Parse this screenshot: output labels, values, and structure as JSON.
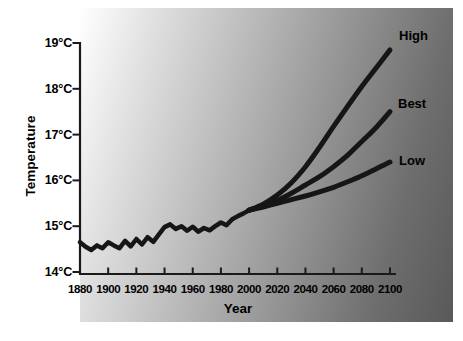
{
  "figure": {
    "background_color": "#ffffff",
    "panel_gradient": {
      "angle_deg": 105,
      "from": "#ffffff",
      "mid": "#a6a6a6",
      "to": "#595959"
    },
    "axis_color": "#1a1a1a",
    "text_color": "#000000"
  },
  "chart_data": {
    "type": "line",
    "title": "",
    "xlabel": "Year",
    "ylabel": "Temperature",
    "xlim": [
      1880,
      2100
    ],
    "ylim": [
      14,
      19
    ],
    "grid": false,
    "legend_position": "labels-at-curve-ends-right",
    "x_ticks": {
      "values": [
        1880,
        1900,
        1920,
        1940,
        1960,
        1980,
        2000,
        2020,
        2040,
        2060,
        2080,
        2100
      ],
      "labels": [
        "1880",
        "1900",
        "1920",
        "1940",
        "1960",
        "1980",
        "2000",
        "2020",
        "2040",
        "2060",
        "2080",
        "2100"
      ]
    },
    "y_ticks": {
      "values": [
        19,
        18,
        17,
        16,
        15,
        14
      ],
      "labels": [
        "19°C",
        "18°C",
        "17°C",
        "16°C",
        "15°C",
        "14°C"
      ]
    },
    "series": [
      {
        "name": "observed-temperature",
        "label": "",
        "color": "#161616",
        "width": 4.5,
        "smooth": false,
        "x": [
          1880,
          1884,
          1888,
          1892,
          1896,
          1900,
          1904,
          1908,
          1912,
          1916,
          1920,
          1924,
          1928,
          1932,
          1936,
          1940,
          1944,
          1948,
          1952,
          1956,
          1960,
          1964,
          1968,
          1972,
          1976,
          1980,
          1984,
          1988,
          1992,
          1996,
          2000
        ],
        "y": [
          14.65,
          14.55,
          14.48,
          14.58,
          14.52,
          14.65,
          14.58,
          14.52,
          14.68,
          14.56,
          14.72,
          14.6,
          14.76,
          14.66,
          14.82,
          14.98,
          15.04,
          14.94,
          15.0,
          14.9,
          14.99,
          14.88,
          14.96,
          14.91,
          15.0,
          15.08,
          15.02,
          15.15,
          15.22,
          15.28,
          15.35
        ]
      },
      {
        "name": "high-projection",
        "label": "High",
        "color": "#161616",
        "width": 5,
        "smooth": true,
        "x": [
          2000,
          2010,
          2020,
          2030,
          2040,
          2050,
          2060,
          2070,
          2080,
          2090,
          2100
        ],
        "y": [
          15.35,
          15.48,
          15.68,
          15.95,
          16.3,
          16.72,
          17.18,
          17.62,
          18.05,
          18.45,
          18.85
        ],
        "label_pos": {
          "x": 399,
          "y": 28
        }
      },
      {
        "name": "best-projection",
        "label": "Best",
        "color": "#161616",
        "width": 5,
        "smooth": true,
        "x": [
          2000,
          2010,
          2020,
          2030,
          2040,
          2050,
          2060,
          2070,
          2080,
          2090,
          2100
        ],
        "y": [
          15.35,
          15.44,
          15.56,
          15.72,
          15.9,
          16.08,
          16.3,
          16.55,
          16.85,
          17.15,
          17.5
        ],
        "label_pos": {
          "x": 398,
          "y": 96
        }
      },
      {
        "name": "low-projection",
        "label": "Low",
        "color": "#161616",
        "width": 5,
        "smooth": true,
        "x": [
          2000,
          2010,
          2020,
          2030,
          2040,
          2050,
          2060,
          2070,
          2080,
          2090,
          2100
        ],
        "y": [
          15.35,
          15.42,
          15.5,
          15.58,
          15.66,
          15.75,
          15.85,
          15.97,
          16.1,
          16.25,
          16.4
        ],
        "label_pos": {
          "x": 399,
          "y": 153
        }
      }
    ]
  }
}
